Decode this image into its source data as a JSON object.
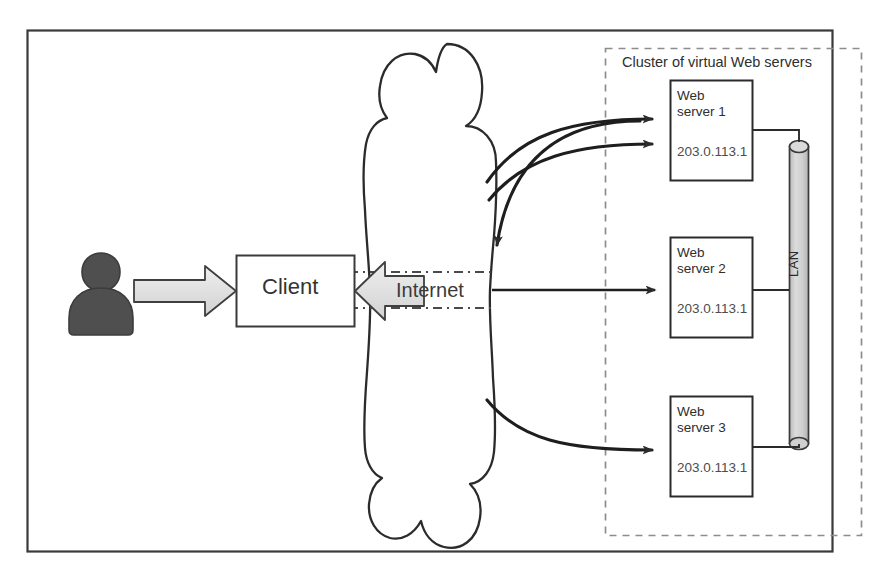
{
  "diagram": {
    "title": "Cluster of virtual Web servers",
    "outer_frame": {
      "name": "diagram-border",
      "color": "#3a3a3a"
    },
    "cluster_box": {
      "label": "Cluster of virtual Web servers",
      "style": "dashed",
      "color": "#8a8a8a"
    },
    "client": {
      "label": "Client"
    },
    "user": {
      "label": "user-silhouette",
      "color": "#4f4f4f"
    },
    "internet": {
      "label": "Internet",
      "shape": "cloud"
    },
    "lan": {
      "label": "LAN",
      "shape": "cylinder",
      "color": "#c9c9c9"
    },
    "servers": [
      {
        "name_line1": "Web",
        "name_line2": "server 1",
        "ip": "203.0.113.1"
      },
      {
        "name_line1": "Web",
        "name_line2": "server 2",
        "ip": "203.0.113.1"
      },
      {
        "name_line1": "Web",
        "name_line2": "server 3",
        "ip": "203.0.113.1"
      }
    ],
    "icons": {
      "user": "person-icon",
      "block_arrow_right": "block-arrow-right-icon",
      "block_arrow_left": "block-arrow-left-icon",
      "arrow_to_server1_a": "curved-arrow-icon",
      "arrow_to_server1_b": "curved-arrow-icon",
      "arrow_into_cloud": "curved-arrow-down-icon",
      "arrow_to_server2": "straight-arrow-icon",
      "arrow_to_server3": "curved-arrow-icon"
    },
    "colors": {
      "line": "#2b2b2b",
      "fill_light": "#e3e3e3",
      "cloud_line": "#2b2b2b",
      "dashed": "#8a8a8a",
      "lan_fill": "#cccccc"
    }
  }
}
